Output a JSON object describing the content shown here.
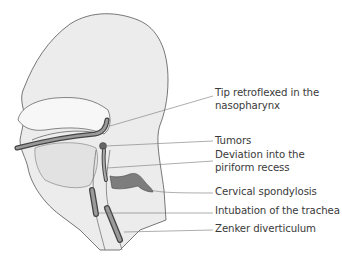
{
  "figure": {
    "colors": {
      "head_fill": "#ececec",
      "outline": "#555555",
      "tube_fill": "#8a8a8a",
      "tube_light": "#bdbdbd",
      "spine_fill": "#7d7d7d",
      "leader_line": "#777777",
      "label_text": "#3a3a3a"
    }
  },
  "labels": [
    {
      "id": "tip",
      "line1": "Tip retroflexed in the",
      "line2": "nasopharynx"
    },
    {
      "id": "tumors",
      "line1": "Tumors"
    },
    {
      "id": "deviation",
      "line1": "Deviation into the",
      "line2": "piriform recess"
    },
    {
      "id": "spondylosis",
      "line1": "Cervical spondylosis"
    },
    {
      "id": "intubation",
      "line1": "Intubation of the trachea"
    },
    {
      "id": "zenker",
      "line1": "Zenker diverticulum"
    }
  ]
}
